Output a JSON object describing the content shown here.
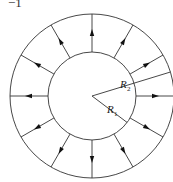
{
  "corner_label": "−1",
  "diagram": {
    "center": [
      92,
      96
    ],
    "outer_radius": 82,
    "inner_radius": 44,
    "stroke_color": "#333333",
    "radial_arrow_angles_deg": [
      0,
      30,
      60,
      90,
      120,
      150,
      180,
      210,
      240,
      270,
      300,
      330
    ],
    "arrow_direction": "outward",
    "labels": [
      {
        "text": "R",
        "subscript": "2",
        "angle_deg": -17,
        "reaches": "outer"
      },
      {
        "text": "R",
        "subscript": "1",
        "angle_deg": 37,
        "reaches": "inner"
      }
    ]
  }
}
